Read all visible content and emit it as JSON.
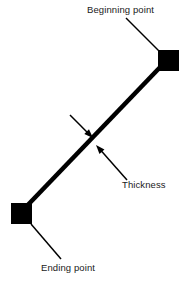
{
  "diagram": {
    "background_color": "#ffffff",
    "stroke_color": "#000000",
    "labels": {
      "beginning_point": "Beginning point",
      "thickness": "Thickness",
      "ending_point": "Ending point"
    },
    "geometry": {
      "canvas_width": 189,
      "canvas_height": 290,
      "main_line": {
        "x1": 167,
        "y1": 60,
        "x2": 23,
        "y2": 210,
        "thickness": 4.6
      },
      "beginning_square": {
        "x": 158,
        "y": 50,
        "size": 21
      },
      "ending_square": {
        "x": 11,
        "y": 203,
        "size": 21
      },
      "leader_beginning": {
        "x1": 126,
        "y1": 18,
        "x2": 160,
        "y2": 52
      },
      "leader_ending": {
        "x1": 31,
        "y1": 224,
        "x2": 61,
        "y2": 259
      },
      "arrow_upper": {
        "x1": 70,
        "y1": 115,
        "x2": 93,
        "y2": 138
      },
      "arrow_lower": {
        "x1": 127,
        "y1": 180,
        "x2": 96,
        "y2": 145
      }
    }
  }
}
